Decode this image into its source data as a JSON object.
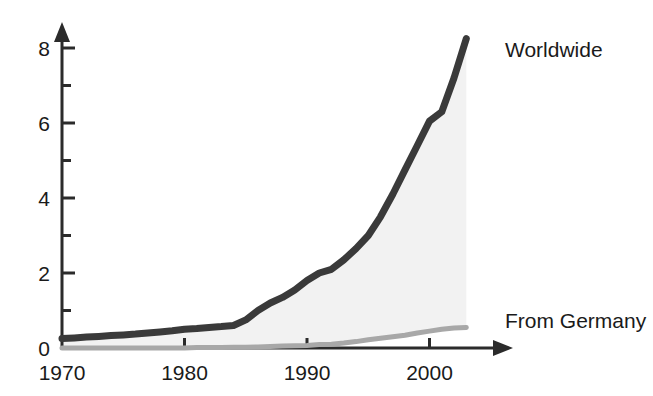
{
  "chart_data": {
    "type": "line",
    "title": "",
    "subtitle": "",
    "xlabel": "",
    "ylabel": "",
    "xlim": [
      1970,
      2003
    ],
    "ylim": [
      0,
      8.6
    ],
    "grid": false,
    "legend_position": "right-of-line-ends",
    "x_ticks": [
      1970,
      1980,
      1990,
      2000
    ],
    "x_tick_labels": [
      "1970",
      "1980",
      "1990",
      "2000"
    ],
    "x_minor_ticks": [],
    "y_ticks": [
      0,
      2,
      4,
      6,
      8
    ],
    "y_tick_labels": [
      "0",
      "2",
      "4",
      "6",
      "8"
    ],
    "y_minor_ticks": [
      1,
      3,
      5,
      7
    ],
    "x": [
      1970,
      1971,
      1972,
      1973,
      1974,
      1975,
      1976,
      1977,
      1978,
      1979,
      1980,
      1981,
      1982,
      1983,
      1984,
      1985,
      1986,
      1987,
      1988,
      1989,
      1990,
      1991,
      1992,
      1993,
      1994,
      1995,
      1996,
      1997,
      1998,
      1999,
      2000,
      2001,
      2002,
      2003
    ],
    "series": [
      {
        "name": "Worldwide",
        "color": "#3a3a3a",
        "line_width": 7,
        "label_anchor_year": 2003,
        "label_anchor_value": 8.25,
        "values": [
          0.25,
          0.27,
          0.29,
          0.31,
          0.33,
          0.35,
          0.37,
          0.4,
          0.43,
          0.46,
          0.5,
          0.52,
          0.55,
          0.57,
          0.6,
          0.75,
          1.0,
          1.2,
          1.35,
          1.55,
          1.8,
          2.0,
          2.1,
          2.35,
          2.65,
          3.0,
          3.5,
          4.1,
          4.75,
          5.4,
          6.05,
          6.3,
          7.2,
          8.25
        ]
      },
      {
        "name": "From Germany",
        "color": "#a8a8a8",
        "line_width": 5,
        "label_anchor_year": 2003,
        "label_anchor_value": 0.55,
        "values": [
          0.0,
          0.0,
          0.0,
          0.0,
          0.0,
          0.0,
          0.0,
          0.0,
          0.0,
          0.0,
          0.0,
          0.01,
          0.01,
          0.01,
          0.02,
          0.02,
          0.03,
          0.04,
          0.05,
          0.06,
          0.07,
          0.09,
          0.1,
          0.13,
          0.17,
          0.22,
          0.26,
          0.3,
          0.34,
          0.4,
          0.45,
          0.5,
          0.53,
          0.55
        ]
      }
    ],
    "fill": {
      "between": [
        "Worldwide",
        "From Germany"
      ],
      "color": "#f2f2f2"
    },
    "axis_color": "#2b2b2b",
    "axis_arrow_heads": [
      "x-right",
      "y-up"
    ]
  },
  "legend": {
    "worldwide_label": "Worldwide",
    "germany_label": "From Germany"
  },
  "axes": {
    "y_labels": [
      "8",
      "6",
      "4",
      "2",
      "0"
    ],
    "x_labels": [
      "1970",
      "1980",
      "1990",
      "2000"
    ]
  }
}
